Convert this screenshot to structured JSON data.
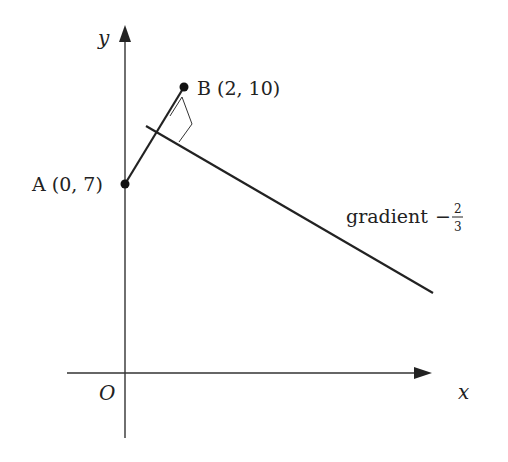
{
  "diagram": {
    "axes": {
      "x_label": "x",
      "y_label": "y",
      "origin_label": "O"
    },
    "points": [
      {
        "id": "A",
        "label": "A (0, 7)",
        "x": 0,
        "y": 7
      },
      {
        "id": "B",
        "label": "B (2, 10)",
        "x": 2,
        "y": 10
      }
    ],
    "segment": {
      "from": "A",
      "to": "B"
    },
    "perpendicular_line": {
      "label_text": "gradient",
      "sign": "−",
      "gradient_numerator": "2",
      "gradient_denominator": "3",
      "right_angle_marker": true
    },
    "colors": {
      "line": "#222222",
      "axis": "#333333",
      "background": "#ffffff"
    }
  }
}
